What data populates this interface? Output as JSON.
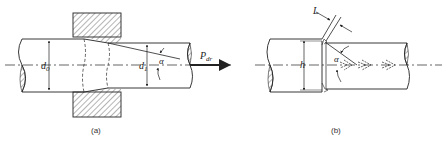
{
  "figure_a": {
    "caption": "(a)",
    "labels": {
      "d0": "d",
      "d0_sub": "0",
      "d1": "d",
      "d1_sub": "1",
      "alpha": "α",
      "force": "P",
      "force_sub": "dr"
    }
  },
  "figure_b": {
    "caption": "(b)",
    "labels": {
      "L": "L",
      "h": "h",
      "alpha": "α"
    }
  },
  "colors": {
    "line": "#222222",
    "hatch": "#444444",
    "background": "#ffffff"
  }
}
